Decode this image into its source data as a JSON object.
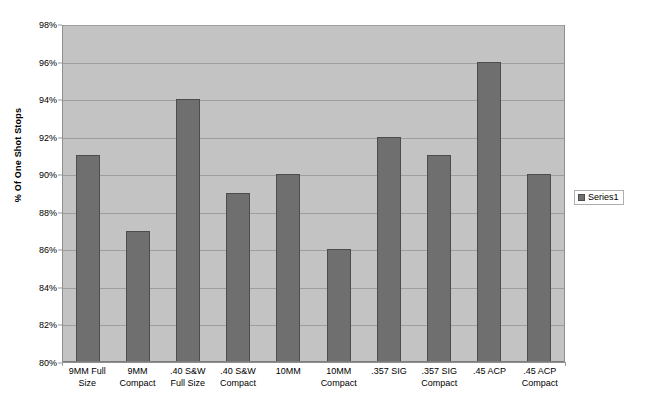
{
  "chart_data": {
    "type": "bar",
    "title": "",
    "subtitle": "",
    "xlabel": "",
    "ylabel": "% Of One Shot Stops",
    "categories": [
      "9MM Full Size",
      "9MM Compact",
      ".40 S&W Full Size",
      ".40 S&W Compact",
      "10MM",
      "10MM Compact",
      ".357 SIG",
      ".357 SIG Compact",
      ".45 ACP",
      ".45 ACP Compact"
    ],
    "values": [
      91,
      87,
      94,
      89,
      90,
      86,
      92,
      91,
      96,
      90
    ],
    "series": [
      {
        "name": "Series1",
        "values": [
          91,
          87,
          94,
          89,
          90,
          86,
          92,
          91,
          96,
          90
        ]
      }
    ],
    "ylim": [
      80,
      98
    ],
    "ytick_step": 2,
    "ytick_labels": [
      "80%",
      "82%",
      "84%",
      "86%",
      "88%",
      "90%",
      "92%",
      "94%",
      "96%",
      "98%"
    ],
    "ytick_values": [
      80,
      82,
      84,
      86,
      88,
      90,
      92,
      94,
      96,
      98
    ],
    "grid": true,
    "grid_axis": "y",
    "legend": {
      "position": "right",
      "entries": [
        "Series1"
      ]
    },
    "colors": {
      "bar_fill": "#706f6f",
      "bar_border": "#4c4c4c",
      "plot_background": "#c3c3c3",
      "gridline": "#9e9e9e",
      "figure_background": "#ffffff",
      "text": "#000000"
    }
  }
}
